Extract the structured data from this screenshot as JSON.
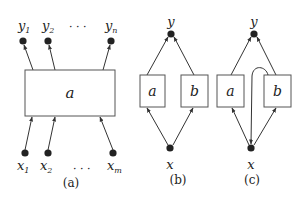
{
  "diagram": {
    "panels": [
      {
        "caption": "(a)",
        "box_label": "a",
        "outputs": [
          "y",
          "y",
          "y"
        ],
        "output_subs": [
          "1",
          "2",
          "n"
        ],
        "inputs": [
          "x",
          "x",
          "x"
        ],
        "input_subs": [
          "1",
          "2",
          "m"
        ],
        "ellipsis": "· · ·"
      },
      {
        "caption": "(b)",
        "top_node": "y",
        "bottom_node": "x",
        "boxes": [
          "a",
          "b"
        ]
      },
      {
        "caption": "(c)",
        "top_node": "y",
        "bottom_node": "x",
        "boxes": [
          "a",
          "b"
        ]
      }
    ],
    "colors": {
      "stroke": "#333333",
      "node": "#222222",
      "box_stroke": "#555555"
    }
  }
}
